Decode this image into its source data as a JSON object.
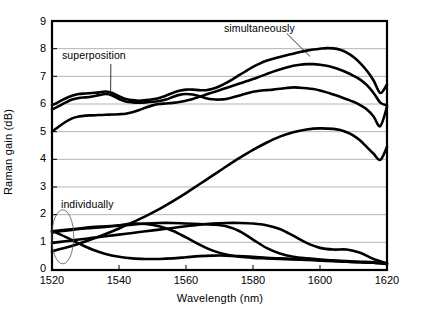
{
  "chart_data": {
    "type": "line",
    "title": "",
    "xlabel": "Wavelength (nm)",
    "ylabel": "Raman gain (dB)",
    "xlim": [
      1520,
      1620
    ],
    "ylim": [
      0,
      9
    ],
    "xticks": [
      1520,
      1540,
      1560,
      1580,
      1600,
      1620
    ],
    "yticks": [
      0,
      1,
      2,
      3,
      4,
      5,
      6,
      7,
      8,
      9
    ],
    "grid": "horizontal",
    "legend": "none",
    "annotations": [
      {
        "text": "superposition",
        "x": 1531,
        "y": 7.55,
        "leader_to_x": 1537.5,
        "leader_to_y": 6.35
      },
      {
        "text": "simultaneously",
        "x": 1571,
        "y": 8.62,
        "leader_to_x": 1597,
        "leader_to_y": 7.72
      },
      {
        "text": "individually",
        "x": 1527,
        "y": 2.35,
        "ellipse_x": 1523.2,
        "ellipse_y": 1.2
      }
    ],
    "series": [
      {
        "name": "superposition",
        "style": "thick",
        "x": [
          1520,
          1522,
          1524,
          1526,
          1528,
          1530,
          1532,
          1534,
          1536,
          1538,
          1540,
          1542,
          1544,
          1546,
          1548,
          1550,
          1552,
          1554,
          1556,
          1558,
          1560,
          1562,
          1564,
          1566,
          1568,
          1570,
          1572,
          1574,
          1576,
          1578,
          1580,
          1582,
          1584,
          1586,
          1588,
          1590,
          1592,
          1594,
          1596,
          1598,
          1600,
          1602,
          1604,
          1606,
          1608,
          1610,
          1612,
          1614,
          1616,
          1618,
          1620
        ],
        "y": [
          5.8,
          5.92,
          6.05,
          6.16,
          6.22,
          6.24,
          6.27,
          6.32,
          6.36,
          6.31,
          6.18,
          6.09,
          6.06,
          6.05,
          6.06,
          6.08,
          6.11,
          6.16,
          6.25,
          6.33,
          6.36,
          6.34,
          6.28,
          6.21,
          6.17,
          6.16,
          6.18,
          6.24,
          6.31,
          6.38,
          6.44,
          6.48,
          6.5,
          6.52,
          6.55,
          6.58,
          6.6,
          6.59,
          6.57,
          6.54,
          6.49,
          6.42,
          6.34,
          6.26,
          6.17,
          6.08,
          5.96,
          5.8,
          5.55,
          5.2,
          5.9
        ]
      },
      {
        "name": "superposition-lower",
        "style": "thick",
        "x": [
          1520,
          1522,
          1524,
          1526,
          1528,
          1530,
          1532,
          1534,
          1536,
          1538,
          1540,
          1542,
          1544,
          1546,
          1548,
          1550,
          1552,
          1554,
          1556,
          1558,
          1560,
          1562,
          1564,
          1566,
          1568,
          1570,
          1572,
          1574,
          1576,
          1578,
          1580,
          1582,
          1584,
          1586,
          1588,
          1590,
          1592,
          1594,
          1596,
          1598,
          1600,
          1602,
          1604,
          1606,
          1608,
          1610,
          1612,
          1614,
          1616,
          1618,
          1620
        ],
        "y": [
          5.0,
          5.18,
          5.35,
          5.48,
          5.55,
          5.58,
          5.59,
          5.6,
          5.61,
          5.62,
          5.63,
          5.65,
          5.7,
          5.78,
          5.87,
          5.95,
          6.0,
          6.02,
          6.04,
          6.07,
          6.12,
          6.18,
          6.26,
          6.34,
          6.42,
          6.5,
          6.58,
          6.66,
          6.74,
          6.82,
          6.9,
          6.99,
          7.08,
          7.17,
          7.25,
          7.32,
          7.38,
          7.42,
          7.44,
          7.44,
          7.42,
          7.38,
          7.32,
          7.24,
          7.14,
          7.02,
          6.88,
          6.68,
          6.4,
          6.05,
          5.95
        ]
      },
      {
        "name": "simultaneously",
        "style": "thick",
        "x": [
          1520,
          1522,
          1524,
          1526,
          1528,
          1530,
          1532,
          1534,
          1536,
          1538,
          1540,
          1542,
          1544,
          1546,
          1548,
          1550,
          1552,
          1554,
          1556,
          1558,
          1560,
          1562,
          1564,
          1566,
          1568,
          1570,
          1572,
          1574,
          1576,
          1578,
          1580,
          1582,
          1584,
          1586,
          1588,
          1590,
          1592,
          1594,
          1596,
          1598,
          1600,
          1602,
          1604,
          1606,
          1608,
          1610,
          1612,
          1614,
          1616,
          1618,
          1620
        ],
        "y": [
          5.95,
          6.08,
          6.2,
          6.3,
          6.36,
          6.38,
          6.4,
          6.42,
          6.45,
          6.4,
          6.28,
          6.18,
          6.14,
          6.12,
          6.14,
          6.17,
          6.22,
          6.3,
          6.4,
          6.48,
          6.52,
          6.52,
          6.5,
          6.5,
          6.55,
          6.64,
          6.76,
          6.9,
          7.05,
          7.2,
          7.34,
          7.46,
          7.56,
          7.64,
          7.7,
          7.76,
          7.82,
          7.88,
          7.93,
          7.97,
          8.0,
          8.02,
          8.01,
          7.96,
          7.86,
          7.7,
          7.48,
          7.2,
          6.85,
          6.4,
          6.7
        ]
      },
      {
        "name": "mid-rising",
        "style": "thick",
        "x": [
          1520,
          1524,
          1528,
          1532,
          1536,
          1540,
          1544,
          1548,
          1552,
          1556,
          1560,
          1564,
          1568,
          1572,
          1576,
          1580,
          1584,
          1588,
          1592,
          1596,
          1600,
          1604,
          1606,
          1608,
          1610,
          1612,
          1614,
          1616,
          1618,
          1620
        ],
        "y": [
          0.68,
          0.8,
          0.95,
          1.12,
          1.3,
          1.5,
          1.72,
          1.95,
          2.2,
          2.48,
          2.78,
          3.1,
          3.42,
          3.74,
          4.05,
          4.34,
          4.6,
          4.82,
          4.98,
          5.08,
          5.12,
          5.1,
          5.06,
          4.98,
          4.86,
          4.68,
          4.44,
          4.2,
          3.98,
          4.45
        ]
      },
      {
        "name": "individual-1",
        "style": "thick",
        "x": [
          1520,
          1524,
          1528,
          1532,
          1536,
          1540,
          1544,
          1548,
          1552,
          1556,
          1560,
          1564,
          1568,
          1572,
          1576,
          1580,
          1584,
          1588,
          1592,
          1596,
          1600,
          1604,
          1608,
          1612,
          1616,
          1620
        ],
        "y": [
          1.4,
          1.45,
          1.5,
          1.55,
          1.58,
          1.62,
          1.68,
          1.66,
          1.58,
          1.42,
          1.18,
          0.92,
          0.7,
          0.56,
          0.48,
          0.44,
          0.42,
          0.4,
          0.38,
          0.36,
          0.34,
          0.32,
          0.3,
          0.28,
          0.26,
          0.22
        ]
      },
      {
        "name": "individual-2",
        "style": "thick",
        "x": [
          1520,
          1524,
          1528,
          1532,
          1536,
          1540,
          1544,
          1548,
          1552,
          1556,
          1560,
          1564,
          1568,
          1572,
          1576,
          1580,
          1584,
          1588,
          1592,
          1596,
          1600,
          1604,
          1608,
          1612,
          1616,
          1620
        ],
        "y": [
          1.36,
          1.42,
          1.48,
          1.52,
          1.56,
          1.6,
          1.64,
          1.68,
          1.7,
          1.7,
          1.68,
          1.66,
          1.64,
          1.58,
          1.4,
          1.1,
          0.8,
          0.6,
          0.48,
          0.42,
          0.38,
          0.34,
          0.3,
          0.28,
          0.26,
          0.22
        ]
      },
      {
        "name": "individual-3",
        "style": "thick",
        "x": [
          1520,
          1524,
          1528,
          1532,
          1536,
          1540,
          1544,
          1548,
          1552,
          1556,
          1560,
          1564,
          1568,
          1572,
          1576,
          1580,
          1584,
          1588,
          1592,
          1596,
          1600,
          1604,
          1608,
          1612,
          1616,
          1620
        ],
        "y": [
          0.98,
          1.04,
          1.1,
          1.16,
          1.22,
          1.28,
          1.34,
          1.4,
          1.46,
          1.52,
          1.58,
          1.64,
          1.68,
          1.7,
          1.7,
          1.68,
          1.62,
          1.48,
          1.24,
          0.98,
          0.8,
          0.74,
          0.74,
          0.62,
          0.4,
          0.24
        ]
      },
      {
        "name": "individual-4",
        "style": "thick",
        "x": [
          1520,
          1524,
          1528,
          1532,
          1536,
          1540,
          1544,
          1548,
          1552,
          1556,
          1560,
          1564,
          1568,
          1572,
          1576,
          1580,
          1584,
          1588,
          1592,
          1596,
          1600,
          1604,
          1608,
          1612,
          1616,
          1620
        ],
        "y": [
          1.42,
          1.2,
          0.96,
          0.74,
          0.58,
          0.48,
          0.42,
          0.4,
          0.4,
          0.42,
          0.46,
          0.5,
          0.52,
          0.52,
          0.5,
          0.48,
          0.44,
          0.42,
          0.4,
          0.38,
          0.36,
          0.34,
          0.32,
          0.3,
          0.28,
          0.22
        ]
      }
    ],
    "colors": {
      "line": "#000000",
      "grid": "#b4b4b4",
      "axis": "#000000",
      "background": "#ffffff"
    }
  },
  "axis": {
    "x_title": "Wavelength (nm)",
    "y_title": "Raman gain (dB)",
    "x_ticks": [
      "1520",
      "1540",
      "1560",
      "1580",
      "1600",
      "1620"
    ],
    "y_ticks": [
      "9",
      "8",
      "7",
      "6",
      "5",
      "4",
      "3",
      "2",
      "1",
      "0"
    ]
  },
  "labels": {
    "superposition": "superposition",
    "simultaneously": "simultaneously",
    "individually": "individually"
  }
}
